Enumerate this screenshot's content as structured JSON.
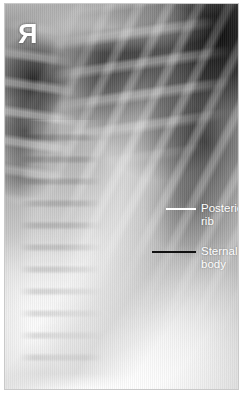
{
  "figure": {
    "kind": "chest-radiograph",
    "modality": "X-ray",
    "view": "oblique chest",
    "frame_border_color": "#c9c9c9",
    "background_color": "#ffffff"
  },
  "markers": {
    "laterality": {
      "glyph": "R",
      "name": "right-side-marker",
      "mirrored": true,
      "color": "#ffffff"
    }
  },
  "annotations": [
    {
      "id": "posterior-rib",
      "label": "Posterior\nrib",
      "line1": "Posterior",
      "line2": "rib",
      "leader_color": "#ffffff",
      "text_color": "#ffffff"
    },
    {
      "id": "sternal-body",
      "label": "Sternal\nbody",
      "line1": "Sternal",
      "line2": "body",
      "leader_color": "#111111",
      "text_color": "#ffffff"
    }
  ]
}
